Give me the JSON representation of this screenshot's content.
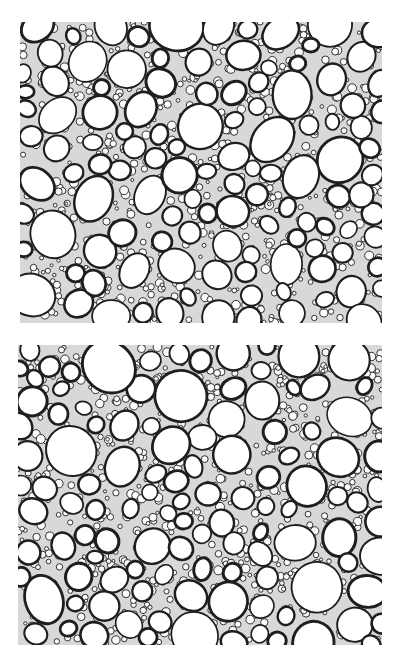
{
  "figure": {
    "panels": [
      {
        "id": "top",
        "description": "micrograph of plant tissue cross-section with large rounded cells in dense network of small cells",
        "cell_wall_color": "#1e1e1e",
        "background_color": "#ffffff"
      },
      {
        "id": "bottom",
        "description": "micrograph of plant tissue cross-section with large rounded cells in dense network of small cells",
        "cell_wall_color": "#1e1e1e",
        "background_color": "#ffffff"
      }
    ]
  }
}
